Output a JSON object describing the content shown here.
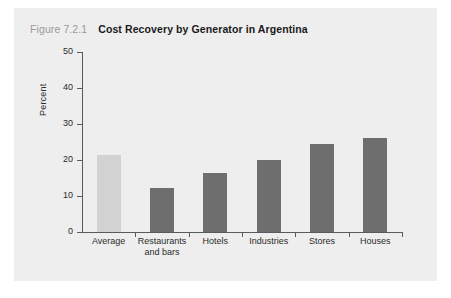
{
  "figure": {
    "number": "Figure 7.2.1",
    "title": "Cost Recovery by Generator in Argentina"
  },
  "colors": {
    "panel_background": "#eeeeee",
    "page_background": "#ffffff",
    "bar_highlight": "#d2d2d2",
    "bar_default": "#6e6e6e",
    "axis": "#5a5a5a",
    "figure_number_text": "#9a9a9a",
    "title_text": "#1a1a1a",
    "tick_text": "#2b2b2b"
  },
  "chart_data": {
    "type": "bar",
    "title": "Cost Recovery by Generator in Argentina",
    "xlabel": "",
    "ylabel": "Percent",
    "ylim": [
      0,
      50
    ],
    "yticks": [
      0,
      10,
      20,
      30,
      40,
      50
    ],
    "ytick_labels": [
      "0",
      "10",
      "20",
      "30",
      "40",
      "50"
    ],
    "grid": false,
    "legend": null,
    "categories": [
      "Average",
      "Restaurants\nand bars",
      "Hotels",
      "Industries",
      "Stores",
      "Houses"
    ],
    "values": [
      21.4,
      12.3,
      16.5,
      20.0,
      24.5,
      26.2
    ],
    "bar_colors": [
      "#d2d2d2",
      "#6e6e6e",
      "#6e6e6e",
      "#6e6e6e",
      "#6e6e6e",
      "#6e6e6e"
    ]
  }
}
